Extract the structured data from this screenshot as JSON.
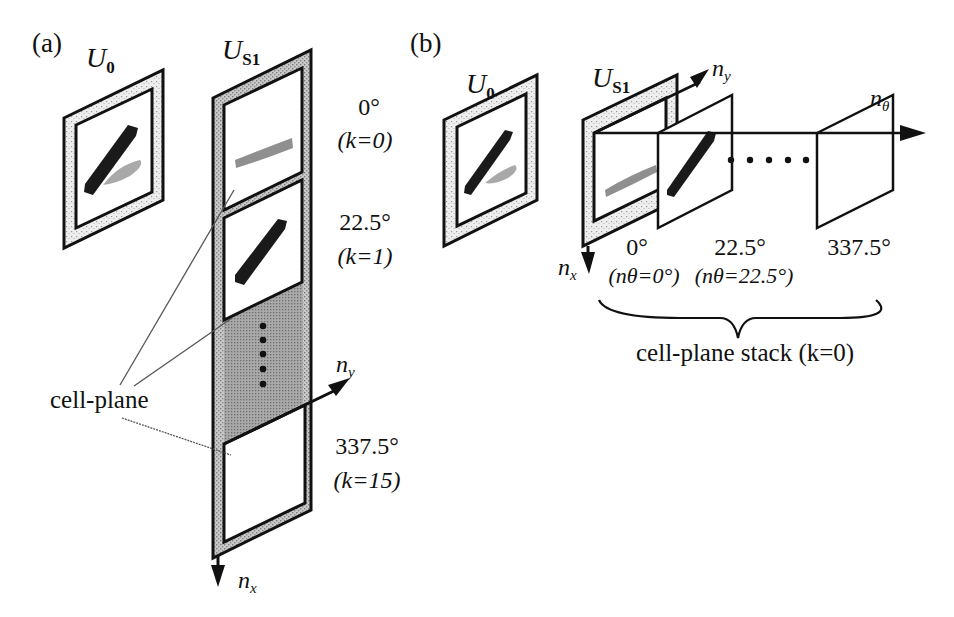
{
  "figure": {
    "panel_a": {
      "label": "(a)",
      "input_layer": {
        "name": "U",
        "subscript": "0"
      },
      "s_layer": {
        "name": "U",
        "subscript": "S1"
      },
      "cell_planes": [
        {
          "angle": "0°",
          "k_label": "(k=0)"
        },
        {
          "angle": "22.5°",
          "k_label": "(k=1)"
        },
        {
          "angle": "337.5°",
          "k_label": "(k=15)"
        }
      ],
      "callout": "cell-plane",
      "axes": {
        "ny": {
          "name": "n",
          "subscript": "y"
        },
        "nx": {
          "name": "n",
          "subscript": "x"
        }
      }
    },
    "panel_b": {
      "label": "(b)",
      "input_layer": {
        "name": "U",
        "subscript": "0"
      },
      "s_layer": {
        "name": "U",
        "subscript": "S1"
      },
      "planes": [
        {
          "angle": "0°",
          "n_theta": "(nθ=0°)"
        },
        {
          "angle": "22.5°",
          "n_theta": "(nθ=22.5°)"
        },
        {
          "angle": "337.5°"
        }
      ],
      "axes": {
        "ny": {
          "name": "n",
          "subscript": "y"
        },
        "nx": {
          "name": "n",
          "subscript": "x"
        },
        "ntheta": {
          "name": "n",
          "subscript": "θ"
        }
      },
      "brace_caption": "cell-plane stack (k=0)"
    },
    "colors": {
      "ink": "#111111",
      "stipple_gray": "#9a9a9a",
      "dark_fill": "#1a1a1a",
      "background": "#ffffff"
    }
  }
}
